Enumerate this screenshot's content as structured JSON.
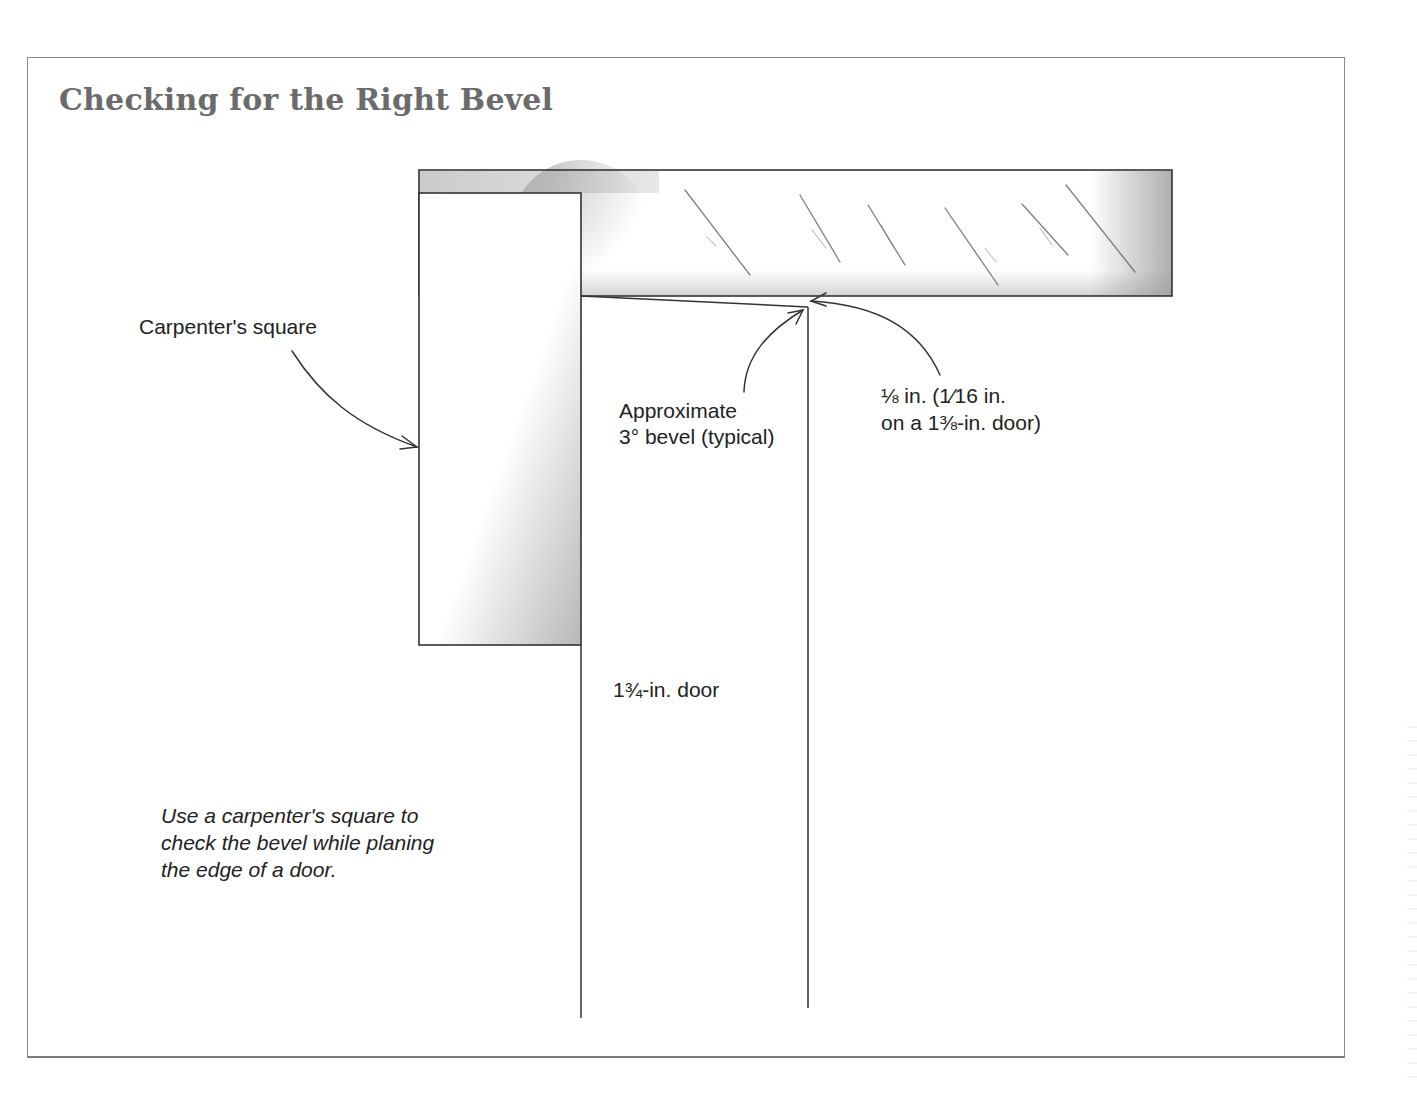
{
  "figure": {
    "title": "Checking for the Right Bevel",
    "labels": {
      "carpenters_square": "Carpenter's square",
      "bevel_line1": "Approximate",
      "bevel_line2": "3° bevel (typical)",
      "offset_line1": "⅛ in. (1⁄16 in.",
      "offset_line2": "on a 1⅜-in. door)",
      "door_thickness": "1¾-in. door"
    },
    "caption": {
      "line1": "Use a carpenter's square to",
      "line2": "check the bevel while planing",
      "line3": "the edge of a door."
    },
    "colors": {
      "title": "#6b6b6b",
      "line": "#333333",
      "frame": "#8a8a8a",
      "shading": "#9a9a9a"
    }
  }
}
